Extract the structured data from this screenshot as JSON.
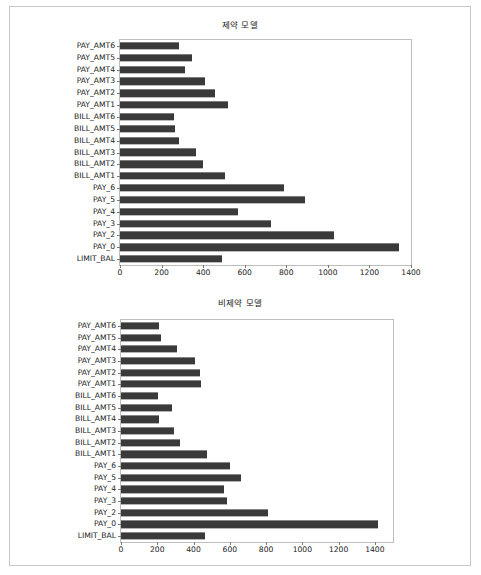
{
  "figure": {
    "background_color": "#ffffff",
    "frame_border_color": "#c9c9c9",
    "bar_color": "#3a3a3a",
    "axis_color": "#bdbdbd",
    "text_color": "#1a1a1a"
  },
  "chart_data": [
    {
      "id": "top",
      "type": "bar",
      "orientation": "horizontal",
      "title": "제약 모델",
      "xlabel": "",
      "ylabel": "",
      "xlim": [
        0,
        1400
      ],
      "ylim": [
        0,
        19
      ],
      "grid": false,
      "legend": false,
      "xticks": [
        0,
        200,
        400,
        600,
        800,
        1000,
        1200,
        1400
      ],
      "xticklabels": [
        "0",
        "200",
        "400",
        "600",
        "800",
        "1000",
        "1200",
        "1400"
      ],
      "categories": [
        "PAY_AMT6",
        "PAY_AMT5",
        "PAY_AMT4",
        "PAY_AMT3",
        "PAY_AMT2",
        "PAY_AMT1",
        "BILL_AMT6",
        "BILL_AMT5",
        "BILL_AMT4",
        "BILL_AMT3",
        "BILL_AMT2",
        "BILL_AMT1",
        "PAY_6",
        "PAY_5",
        "PAY_4",
        "PAY_3",
        "PAY_2",
        "PAY_0",
        "LIMIT_BAL"
      ],
      "values": [
        282,
        345,
        313,
        410,
        455,
        520,
        258,
        263,
        282,
        368,
        400,
        507,
        787,
        890,
        568,
        727,
        1030,
        1340,
        492
      ]
    },
    {
      "id": "bottom",
      "type": "bar",
      "orientation": "horizontal",
      "title": "비제약 모델",
      "xlabel": "",
      "ylabel": "",
      "xlim": [
        0,
        1500
      ],
      "ylim": [
        0,
        19
      ],
      "grid": false,
      "legend": false,
      "xticks": [
        0,
        200,
        400,
        600,
        800,
        1000,
        1200,
        1400
      ],
      "xticklabels": [
        "0",
        "200",
        "400",
        "600",
        "800",
        "1000",
        "1200",
        "1400"
      ],
      "categories": [
        "PAY_AMT6",
        "PAY_AMT5",
        "PAY_AMT4",
        "PAY_AMT3",
        "PAY_AMT2",
        "PAY_AMT1",
        "BILL_AMT6",
        "BILL_AMT5",
        "BILL_AMT4",
        "BILL_AMT3",
        "BILL_AMT2",
        "BILL_AMT1",
        "PAY_6",
        "PAY_5",
        "PAY_4",
        "PAY_3",
        "PAY_2",
        "PAY_0",
        "LIMIT_BAL"
      ],
      "values": [
        212,
        222,
        308,
        410,
        437,
        443,
        203,
        282,
        210,
        295,
        325,
        475,
        600,
        662,
        570,
        587,
        808,
        1418,
        463
      ]
    }
  ]
}
